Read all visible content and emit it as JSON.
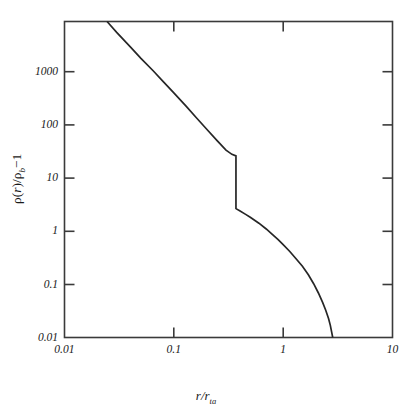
{
  "figure": {
    "background_color": "#ffffff",
    "line_color": "#262626",
    "axis_color": "#3a3a3a"
  },
  "axes": {
    "x_title_main": "r",
    "x_title_slash": "/",
    "x_title_den": "r",
    "x_title_sub": "ta",
    "y_title_rho1": "ρ",
    "y_title_open": "(",
    "y_title_r": "r",
    "y_title_close": ")",
    "y_title_slash": "/",
    "y_title_rho2": "ρ",
    "y_title_sub": "b",
    "y_title_minus": "−",
    "y_title_one": "1"
  },
  "chart_data": {
    "type": "line",
    "title": "",
    "xlabel": "r/r_ta",
    "ylabel": "rho(r)/rho_b - 1",
    "xscale": "log",
    "yscale": "log",
    "xlim": [
      0.01,
      10
    ],
    "ylim": [
      0.01,
      10000
    ],
    "grid": false,
    "legend": null,
    "x_tick_labels": [
      "0.01",
      "0.1",
      "1",
      "10"
    ],
    "x_tick_values": [
      0.01,
      0.1,
      1,
      10
    ],
    "y_tick_labels": [
      "0.01",
      "0.1",
      "1",
      "10",
      "100",
      "1000"
    ],
    "y_tick_values": [
      0.01,
      0.1,
      1,
      10,
      100,
      1000
    ],
    "annotations": [
      {
        "name": "caustic-discontinuity",
        "x": 0.37,
        "y_top": 28,
        "y_bottom": 2.8
      }
    ],
    "series": [
      {
        "name": "density profile",
        "comment": "self-similar secondary-infall density profile with caustic jump at r/r_ta = 0.37",
        "points": [
          [
            0.0245,
            10000
          ],
          [
            0.03,
            6200
          ],
          [
            0.04,
            3300
          ],
          [
            0.05,
            2000
          ],
          [
            0.065,
            1150
          ],
          [
            0.08,
            720
          ],
          [
            0.1,
            440
          ],
          [
            0.13,
            245
          ],
          [
            0.16,
            150
          ],
          [
            0.2,
            90
          ],
          [
            0.25,
            54
          ],
          [
            0.3,
            36
          ],
          [
            0.34,
            30
          ],
          [
            0.37,
            28
          ],
          [
            0.37,
            2.8
          ],
          [
            0.4,
            2.55
          ],
          [
            0.45,
            2.2
          ],
          [
            0.5,
            1.92
          ],
          [
            0.6,
            1.48
          ],
          [
            0.7,
            1.15
          ],
          [
            0.8,
            0.9
          ],
          [
            0.9,
            0.72
          ],
          [
            1.0,
            0.58
          ],
          [
            1.15,
            0.43
          ],
          [
            1.3,
            0.32
          ],
          [
            1.5,
            0.225
          ],
          [
            1.7,
            0.155
          ],
          [
            1.9,
            0.105
          ],
          [
            2.1,
            0.07
          ],
          [
            2.3,
            0.046
          ],
          [
            2.45,
            0.033
          ],
          [
            2.6,
            0.023
          ],
          [
            2.7,
            0.017
          ],
          [
            2.78,
            0.0125
          ],
          [
            2.84,
            0.01
          ]
        ]
      }
    ]
  }
}
